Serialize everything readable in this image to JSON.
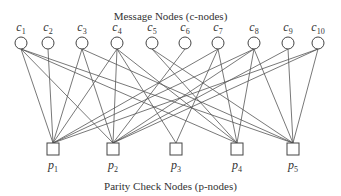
{
  "diagram": {
    "top_title": "Message Nodes (c-nodes)",
    "bottom_title": "Parity Check Nodes (p-nodes)",
    "c_nodes": [
      {
        "id": "c1",
        "letter": "c",
        "index": "1",
        "x": 21
      },
      {
        "id": "c2",
        "letter": "c",
        "index": "2",
        "x": 48
      },
      {
        "id": "c3",
        "letter": "c",
        "index": "3",
        "x": 82
      },
      {
        "id": "c4",
        "letter": "c",
        "index": "4",
        "x": 117
      },
      {
        "id": "c5",
        "letter": "c",
        "index": "5",
        "x": 152
      },
      {
        "id": "c6",
        "letter": "c",
        "index": "6",
        "x": 185
      },
      {
        "id": "c7",
        "letter": "c",
        "index": "7",
        "x": 218
      },
      {
        "id": "c8",
        "letter": "c",
        "index": "8",
        "x": 254
      },
      {
        "id": "c9",
        "letter": "c",
        "index": "9",
        "x": 288
      },
      {
        "id": "c10",
        "letter": "c",
        "index": "10",
        "x": 318
      }
    ],
    "p_nodes": [
      {
        "id": "p1",
        "letter": "p",
        "index": "1",
        "x": 53
      },
      {
        "id": "p2",
        "letter": "p",
        "index": "2",
        "x": 113
      },
      {
        "id": "p3",
        "letter": "p",
        "index": "3",
        "x": 176
      },
      {
        "id": "p4",
        "letter": "p",
        "index": "4",
        "x": 237
      },
      {
        "id": "p5",
        "letter": "p",
        "index": "5",
        "x": 293
      }
    ],
    "edges": [
      [
        "c1",
        "p1"
      ],
      [
        "c1",
        "p2"
      ],
      [
        "c1",
        "p4"
      ],
      [
        "c1",
        "p5"
      ],
      [
        "c2",
        "p1"
      ],
      [
        "c3",
        "p1"
      ],
      [
        "c3",
        "p2"
      ],
      [
        "c3",
        "p5"
      ],
      [
        "c4",
        "p1"
      ],
      [
        "c4",
        "p2"
      ],
      [
        "c4",
        "p3"
      ],
      [
        "c4",
        "p4"
      ],
      [
        "c5",
        "p4"
      ],
      [
        "c5",
        "p5"
      ],
      [
        "c6",
        "p2"
      ],
      [
        "c7",
        "p1"
      ],
      [
        "c7",
        "p3"
      ],
      [
        "c7",
        "p4"
      ],
      [
        "c8",
        "p1"
      ],
      [
        "c8",
        "p2"
      ],
      [
        "c8",
        "p4"
      ],
      [
        "c8",
        "p5"
      ],
      [
        "c9",
        "p2"
      ],
      [
        "c9",
        "p5"
      ],
      [
        "c10",
        "p1"
      ],
      [
        "c10",
        "p2"
      ],
      [
        "c10",
        "p5"
      ]
    ],
    "colors": {
      "line": "#555555",
      "node_stroke": "#444444",
      "node_fill": "#ffffff"
    }
  }
}
